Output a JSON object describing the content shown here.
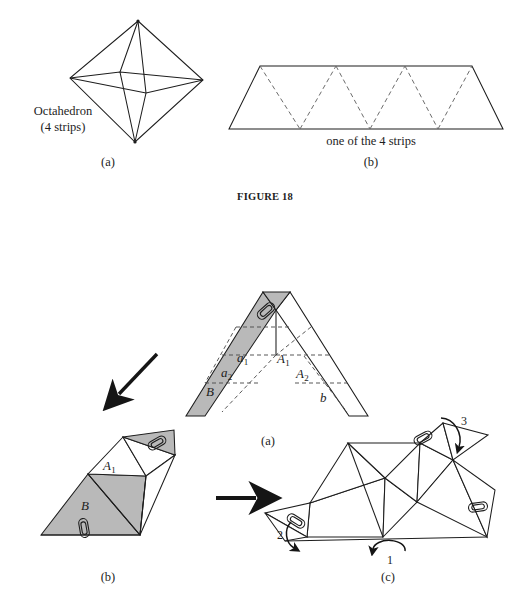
{
  "figure": {
    "caption": "FIGURE 18",
    "caption_pos": {
      "x": 265,
      "y": 196
    }
  },
  "top": {
    "panel_a": {
      "tag": "(a)",
      "tag_pos": {
        "x": 108,
        "y": 161
      },
      "label_line1": "Octahedron",
      "label_line2": "(4 strips)",
      "label_pos": {
        "x": 63,
        "y": 109
      },
      "shape": {
        "type": "octahedron",
        "top": [
          138,
          21
        ],
        "bottom": [
          135,
          142
        ],
        "left": [
          70,
          78
        ],
        "right": [
          203,
          80
        ],
        "front": [
          146,
          93
        ],
        "back": [
          120,
          72
        ]
      }
    },
    "panel_b": {
      "tag": "(b)",
      "tag_pos": {
        "x": 371,
        "y": 161
      },
      "label": "one of the 4 strips",
      "label_pos": {
        "x": 371,
        "y": 139
      },
      "shape": {
        "type": "triangle-strip",
        "top_left": [
          260,
          66
        ],
        "top_right": [
          472,
          66
        ],
        "bottom_left": [
          229,
          129
        ],
        "bottom_right": [
          503,
          129
        ],
        "dashed_folds": [
          [
            [
              260,
              66
            ],
            [
              300,
              129
            ]
          ],
          [
            [
              300,
              129
            ],
            [
              336,
              66
            ]
          ],
          [
            [
              336,
              66
            ],
            [
              370,
              129
            ]
          ],
          [
            [
              370,
              129
            ],
            [
              405,
              66
            ]
          ],
          [
            [
              405,
              66
            ],
            [
              438,
              129
            ]
          ],
          [
            [
              438,
              129
            ],
            [
              472,
              66
            ]
          ]
        ]
      }
    }
  },
  "bottom": {
    "panel_a": {
      "tag": "(a)",
      "tag_pos": {
        "x": 268,
        "y": 440
      },
      "labels": [
        {
          "text": "a",
          "sub": "1",
          "x": 243,
          "y": 359,
          "name": "label-a1"
        },
        {
          "text": "a",
          "sub": "2",
          "x": 228,
          "y": 373,
          "name": "label-a2"
        },
        {
          "text": "A",
          "sub": "1",
          "x": 283,
          "y": 360,
          "name": "label-A1"
        },
        {
          "text": "A",
          "sub": "2",
          "x": 302,
          "y": 374,
          "name": "label-A2"
        },
        {
          "text": "B",
          "sub": "",
          "x": 211,
          "y": 392,
          "name": "label-B"
        },
        {
          "text": "b",
          "sub": "",
          "x": 324,
          "y": 398,
          "name": "label-b"
        }
      ],
      "left_arm": {
        "fill": "#b9b9b9",
        "apex_outer": [
          263,
          292
        ],
        "apex_inner": [
          276,
          310
        ],
        "base_outer": [
          186,
          416
        ],
        "base_inner": [
          205,
          416
        ],
        "dashed_folds": [
          [
            [
              222,
              355
            ],
            [
              276,
              355
            ]
          ],
          [
            [
              208,
              383
            ],
            [
              254,
              383
            ]
          ],
          [
            [
              237,
              326
            ],
            [
              222,
              355
            ]
          ],
          [
            [
              250,
              355
            ],
            [
              208,
              383
            ]
          ],
          [
            [
              222,
              383
            ],
            [
              196,
              416
            ]
          ],
          [
            [
              237,
              326
            ],
            [
              276,
              326
            ]
          ]
        ]
      },
      "right_arm": {
        "fill": "#ffffff",
        "apex_outer": [
          276,
          310
        ],
        "apex_inner": [
          290,
          292
        ],
        "base_outer": [
          349,
          416
        ],
        "base_inner": [
          368,
          416
        ],
        "dashed_folds": [
          [
            [
              276,
              355
            ],
            [
              330,
              355
            ]
          ],
          [
            [
              295,
              383
            ],
            [
              345,
              383
            ]
          ],
          [
            [
              311,
              326
            ],
            [
              276,
              355
            ]
          ],
          [
            [
              304,
              355
            ],
            [
              345,
              383
            ]
          ],
          [
            [
              330,
              383
            ],
            [
              358,
              416
            ]
          ],
          [
            [
              290,
              326
            ],
            [
              311,
              326
            ]
          ]
        ]
      },
      "paperclip": {
        "x": 265,
        "y": 312,
        "angle": -40
      }
    },
    "panel_b": {
      "tag": "(b)",
      "tag_pos": {
        "x": 108,
        "y": 576
      },
      "label_A1": {
        "text": "A",
        "sub": "1",
        "x": 110,
        "y": 466
      },
      "label_B": {
        "text": "B",
        "sub": "",
        "x": 86,
        "y": 506
      },
      "fill": "#b9b9b9",
      "paperclips": [
        {
          "x": 158,
          "y": 438,
          "angle": -32
        },
        {
          "x": 83,
          "y": 528,
          "angle": 82
        }
      ]
    },
    "panel_c": {
      "tag": "(c)",
      "tag_pos": {
        "x": 388,
        "y": 576
      },
      "arrow_labels": [
        {
          "num": "1",
          "x": 391,
          "y": 560,
          "name": "rotation-arrow-1"
        },
        {
          "num": "2",
          "x": 281,
          "y": 535,
          "name": "rotation-arrow-2"
        },
        {
          "num": "3",
          "x": 465,
          "y": 422,
          "name": "rotation-arrow-3"
        }
      ],
      "paperclips": [
        {
          "x": 421,
          "y": 438,
          "angle": -30
        },
        {
          "x": 478,
          "y": 507,
          "angle": -10
        },
        {
          "x": 298,
          "y": 519,
          "angle": 35
        }
      ]
    },
    "connector_arrows": [
      {
        "name": "diagonal-arrow",
        "x1": 157,
        "y1": 355,
        "x2": 114,
        "y2": 400
      },
      {
        "name": "horizontal-arrow",
        "x1": 216,
        "y1": 498,
        "x2": 262,
        "y2": 498
      }
    ]
  },
  "colors": {
    "ink": "#1d1d1d",
    "shade": "#b9b9b9",
    "paper": "#ffffff"
  }
}
